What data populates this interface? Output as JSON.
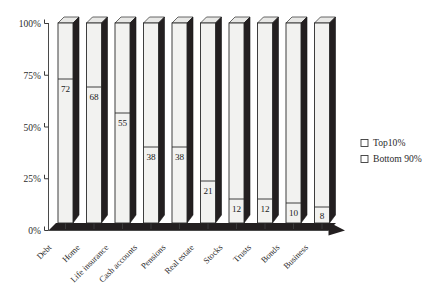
{
  "chart_data": {
    "type": "bar",
    "title": "",
    "subtitle": "",
    "xlabel": "",
    "ylabel": "",
    "ylim": [
      0,
      100
    ],
    "grid": false,
    "stacked": true,
    "units": "percent",
    "legend_position": "right",
    "categories": [
      "Debt",
      "Home",
      "Life insurance",
      "Cash accounts",
      "Pensions",
      "Real estate",
      "Stocks",
      "Trusts",
      "Bonds",
      "Business"
    ],
    "ytick_labels": [
      "0%",
      "25%",
      "50%",
      "75%",
      "100%"
    ],
    "ytick_values": [
      0,
      25,
      50,
      75,
      100
    ],
    "series": [
      {
        "name": "Bottom 90%",
        "values": [
          72,
          68,
          55,
          38,
          38,
          21,
          12,
          12,
          10,
          8
        ],
        "data_labels": [
          "72",
          "68",
          "55",
          "38",
          "38",
          "21",
          "12",
          "12",
          "10",
          "8"
        ]
      },
      {
        "name": "Top 10%",
        "values": [
          28,
          32,
          45,
          62,
          62,
          79,
          88,
          88,
          90,
          92
        ],
        "data_labels": [
          "",
          "",
          "",
          "",
          "",
          "",
          "",
          "",
          "",
          ""
        ]
      }
    ],
    "legend": [
      {
        "label": "Top10%",
        "marker": "open-square"
      },
      {
        "label": "Bottom 90%",
        "marker": "open-square"
      }
    ],
    "colors": {
      "bar_front": "#f2f2f0",
      "bar_side": "#231f20",
      "bar_top": "#e8e8e6",
      "axis": "#4a4a4a",
      "text": "#2b2b2b",
      "background": "#ffffff"
    }
  }
}
